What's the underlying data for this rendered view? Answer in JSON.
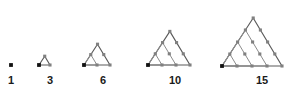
{
  "figure": {
    "type": "triangular-number-lattice-sequence",
    "background_color": "#ffffff",
    "label_color": "#1a1a1a",
    "anchor_dot_color": "#111111",
    "lattice_dot_color": "#808080",
    "edge_color": "#8c8c8c",
    "outer_edge_color": "#5a5a5a",
    "label_baseline_y": 85,
    "terms": [
      {
        "label": "1",
        "order": 1,
        "rows": 1,
        "dot_count": 1,
        "base_x": 11,
        "base_y": 65,
        "cell": 0,
        "label_x": 11
      },
      {
        "label": "3",
        "order": 2,
        "rows": 2,
        "dot_count": 3,
        "base_x": 39,
        "base_y": 65,
        "cell": 11,
        "label_x": 50
      },
      {
        "label": "6",
        "order": 3,
        "rows": 3,
        "dot_count": 6,
        "base_x": 84,
        "base_y": 65,
        "cell": 13,
        "label_x": 103
      },
      {
        "label": "10",
        "order": 4,
        "rows": 4,
        "dot_count": 10,
        "base_x": 148,
        "base_y": 65,
        "cell": 14,
        "label_x": 175
      },
      {
        "label": "15",
        "order": 5,
        "rows": 5,
        "dot_count": 15,
        "base_x": 222,
        "base_y": 66,
        "cell": 15,
        "label_x": 262
      }
    ]
  },
  "chart_data": {
    "type": "scatter",
    "categories": [
      "1",
      "3",
      "6",
      "10",
      "15"
    ],
    "values": [
      1,
      3,
      6,
      10,
      15
    ],
    "series": [
      {
        "name": "Triangular number T(n)",
        "values": [
          1,
          3,
          6,
          10,
          15
        ]
      },
      {
        "name": "Row count n",
        "values": [
          1,
          2,
          3,
          4,
          5
        ]
      }
    ],
    "xlabel": "",
    "ylabel": "",
    "annotations": [
      "1",
      "3",
      "6",
      "10",
      "15"
    ],
    "grid": false,
    "legend": "none"
  }
}
